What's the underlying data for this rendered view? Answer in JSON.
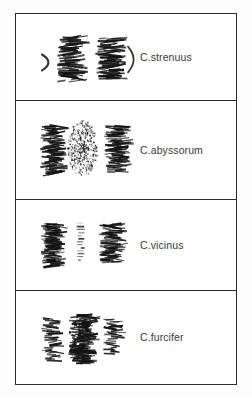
{
  "figure": {
    "type": "plate",
    "background_color": "#ffffff",
    "ink_color": "#1a1a1a",
    "border_color": "#2a2a2a",
    "label_color": "#3a3a3a",
    "panel_count": 4
  },
  "panels": [
    {
      "index": 1,
      "label": "C.strenuus",
      "art_name": "chromosome-cluster-strenuus",
      "clusters": [
        {
          "name": "cluster-left-arc",
          "kind": "thin-arc",
          "x": 26,
          "y_center": 49,
          "height": 16,
          "width": 8,
          "density": "sparse"
        },
        {
          "name": "cluster-mid-dense",
          "kind": "banded",
          "x": 52,
          "y_center": 46,
          "height": 46,
          "width": 22,
          "density": "dense"
        },
        {
          "name": "cluster-right-dense",
          "kind": "banded",
          "x": 90,
          "y_center": 45,
          "height": 42,
          "width": 22,
          "density": "dense"
        },
        {
          "name": "cluster-right-arc",
          "kind": "thin-arc",
          "x": 112,
          "y_center": 46,
          "height": 26,
          "width": 7,
          "density": "sparse"
        }
      ]
    },
    {
      "index": 2,
      "label": "C.abyssorum",
      "art_name": "chromosome-cluster-abyssorum",
      "clusters": [
        {
          "name": "cluster-left-dense",
          "kind": "banded",
          "x": 34,
          "y_center": 50,
          "height": 50,
          "width": 20,
          "density": "dense"
        },
        {
          "name": "cluster-mid-stipple",
          "kind": "stipple",
          "x": 66,
          "y_center": 47,
          "height": 56,
          "width": 30,
          "density": "speckled"
        },
        {
          "name": "cluster-right-dense",
          "kind": "banded",
          "x": 98,
          "y_center": 49,
          "height": 48,
          "width": 20,
          "density": "dense"
        }
      ]
    },
    {
      "index": 3,
      "label": "C.vicinus",
      "art_name": "chromosome-cluster-vicinus",
      "clusters": [
        {
          "name": "cluster-left-dense",
          "kind": "banded",
          "x": 34,
          "y_center": 46,
          "height": 44,
          "width": 18,
          "density": "dense"
        },
        {
          "name": "cluster-mid-faint",
          "kind": "dotted-line",
          "x": 65,
          "y_center": 43,
          "height": 40,
          "width": 9,
          "density": "faint"
        },
        {
          "name": "cluster-right-dense",
          "kind": "banded",
          "x": 93,
          "y_center": 44,
          "height": 40,
          "width": 20,
          "density": "dense"
        }
      ]
    },
    {
      "index": 4,
      "label": "C.furcifer",
      "art_name": "chromosome-cluster-furcifer",
      "clusters": [
        {
          "name": "cluster-left-medium",
          "kind": "banded",
          "x": 33,
          "y_center": 49,
          "height": 44,
          "width": 16,
          "density": "medium"
        },
        {
          "name": "cluster-mid-blob",
          "kind": "blob",
          "x": 63,
          "y_center": 48,
          "height": 50,
          "width": 22,
          "density": "very-dense"
        },
        {
          "name": "cluster-right-medium",
          "kind": "banded",
          "x": 95,
          "y_center": 46,
          "height": 36,
          "width": 16,
          "density": "medium"
        }
      ]
    }
  ]
}
